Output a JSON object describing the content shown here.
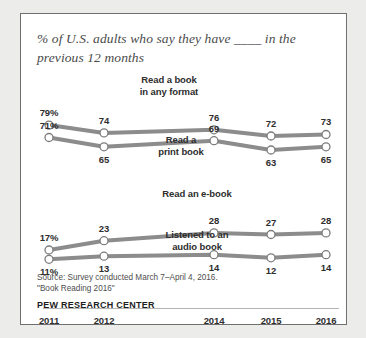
{
  "card": {
    "title": "% of U.S. adults who say they have ____ in the previous 12 months",
    "source": "Source: Survey conducted March 7–April 4, 2016.\n\"Book Reading 2016\"",
    "org": "PEW RESEARCH CENTER"
  },
  "chart_data": {
    "type": "line",
    "title": "% of U.S. adults who say they have ____ in the previous 12 months",
    "xlabel": "",
    "ylabel": "",
    "ylim": [
      0,
      100
    ],
    "grid": false,
    "legend_position": "inline-labels",
    "categories": [
      "2011",
      "2012",
      "2014",
      "2015",
      "2016"
    ],
    "x_positions": [
      2011,
      2012,
      2014,
      2015,
      2016
    ],
    "series": [
      {
        "name": "Read a book in any format",
        "values": [
          79,
          74,
          76,
          72,
          73
        ],
        "point_labels": [
          "79%",
          "74",
          "76",
          "72",
          "73"
        ],
        "color": "#8c8c8c"
      },
      {
        "name": "Read a print book",
        "values": [
          71,
          65,
          69,
          63,
          65
        ],
        "point_labels": [
          "71%",
          "65",
          "69",
          "63",
          "65"
        ],
        "color": "#8c8c8c"
      },
      {
        "name": "Read an e-book",
        "values": [
          17,
          23,
          28,
          27,
          28
        ],
        "point_labels": [
          "17%",
          "23",
          "28",
          "27",
          "28"
        ],
        "color": "#8c8c8c"
      },
      {
        "name": "Listened to an audio book",
        "values": [
          11,
          13,
          14,
          12,
          14
        ],
        "point_labels": [
          "11%",
          "13",
          "14",
          "12",
          "14"
        ],
        "color": "#8c8c8c"
      }
    ]
  },
  "axis": {
    "ticks": [
      "2011",
      "2012",
      "2014",
      "2015",
      "2016"
    ]
  },
  "series_labels": [
    {
      "text": "Read a book\nin any format"
    },
    {
      "text": "Read a\nprint book"
    },
    {
      "text": "Read an e-book"
    },
    {
      "text": "Listened to an\naudio book"
    }
  ]
}
